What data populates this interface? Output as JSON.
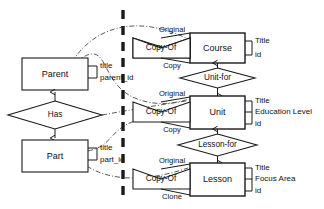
{
  "diagram": {
    "type": "er-diagram",
    "background_color": "#ffffff",
    "stroke_color": "#1a1a1a",
    "mapping_link_color": "#5a5a5a"
  },
  "left_panel": {
    "label": "generic-pattern",
    "entities": [
      {
        "name": "Parent",
        "attributes": [
          "title",
          "parent_id"
        ]
      },
      {
        "name": "Part",
        "attributes": [
          "title",
          "part_id"
        ]
      }
    ],
    "relationships": [
      {
        "name": "Has",
        "from": "Part",
        "to": "Parent"
      }
    ]
  },
  "divider": {
    "name": "vertical-dashed-divider",
    "style": "thick-dashed"
  },
  "right_panel": {
    "label": "concrete-instantiation",
    "groups": [
      {
        "id": "course",
        "entity": "Course",
        "attributes": [
          "Title",
          "id"
        ],
        "self_relationship": {
          "name": "Copy-Of",
          "role_top": "Original",
          "role_bottom": "Copy"
        }
      },
      {
        "id": "unit",
        "entity": "Unit",
        "attributes": [
          "Title",
          "Education Level",
          "id"
        ],
        "self_relationship": {
          "name": "Copy-Of",
          "role_top": "Original",
          "role_bottom": "Copy"
        },
        "parent_relationship": {
          "name": "Unit-for",
          "from": "Unit",
          "to": "Course"
        }
      },
      {
        "id": "lesson",
        "entity": "Lesson",
        "attributes": [
          "Title",
          "Focus Area",
          "id"
        ],
        "self_relationship": {
          "name": "Copy-Of",
          "role_top": "Original",
          "role_bottom": "Clone"
        },
        "parent_relationship": {
          "name": "Lesson-for",
          "from": "Lesson",
          "to": "Unit"
        }
      }
    ]
  }
}
